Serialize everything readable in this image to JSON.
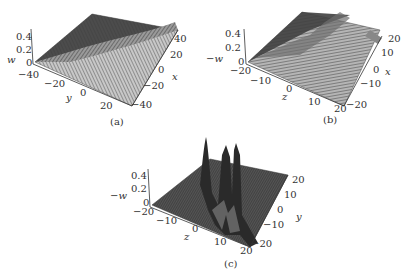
{
  "figure": {
    "panels": [
      {
        "id": "a",
        "caption": "(a)",
        "vertical_axis": {
          "label": "w",
          "ticks": [
            "0",
            "0.2",
            "0.4"
          ]
        },
        "left_axis": {
          "label": "y",
          "ticks": [
            "-40",
            "-20",
            "0",
            "20"
          ]
        },
        "right_axis": {
          "label": "x",
          "ticks": [
            "40",
            "20",
            "0",
            "-20",
            "-40"
          ]
        }
      },
      {
        "id": "b",
        "caption": "(b)",
        "vertical_axis": {
          "label": "-w",
          "ticks": [
            "0",
            "0.2",
            "0.4"
          ]
        },
        "left_axis": {
          "label": "z",
          "ticks": [
            "-20",
            "-10",
            "0",
            "10",
            "20"
          ]
        },
        "right_axis": {
          "label": "x",
          "ticks": [
            "20",
            "10",
            "0",
            "-10",
            "-20"
          ]
        }
      },
      {
        "id": "c",
        "caption": "(c)",
        "vertical_axis": {
          "label": "-w",
          "ticks": [
            "0",
            "0.2",
            "0.4"
          ]
        },
        "left_axis": {
          "label": "z",
          "ticks": [
            "-20",
            "-10",
            "0",
            "10",
            "20"
          ]
        },
        "right_axis": {
          "label": "y",
          "ticks": [
            "20",
            "10",
            "0",
            "-10",
            "-20"
          ]
        }
      }
    ]
  },
  "colors": {
    "surface_dark": "#3a3a3a",
    "surface_mid": "#7a7a7a",
    "surface_light": "#bdbdbd",
    "axis": "#333333"
  }
}
